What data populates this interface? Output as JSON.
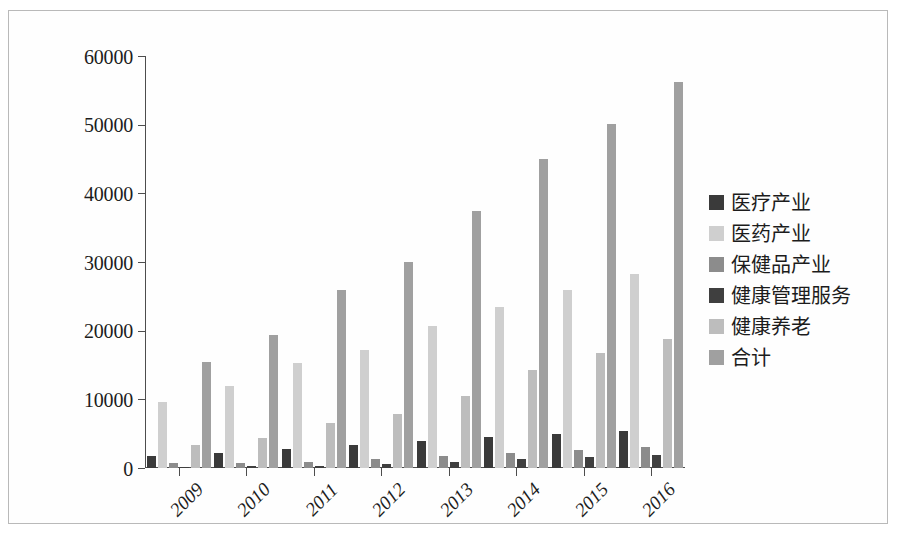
{
  "chart_data": {
    "type": "bar",
    "title": "",
    "subtitle": "",
    "xlabel": "",
    "ylabel": "",
    "categories": [
      "2009",
      "2010",
      "2011",
      "2012",
      "2013",
      "2014",
      "2015",
      "2016"
    ],
    "ylim": [
      0,
      60000
    ],
    "yticks": [
      0,
      10000,
      20000,
      30000,
      40000,
      50000,
      60000
    ],
    "ytick_labels": [
      "0",
      "10000",
      "20000",
      "30000",
      "40000",
      "50000",
      "60000"
    ],
    "grid": false,
    "legend_position": "right",
    "series": [
      {
        "name": "医疗产业",
        "color": "#3a3a3a",
        "values": [
          1800,
          2200,
          2800,
          3300,
          3900,
          4500,
          5000,
          5400
        ]
      },
      {
        "name": "医药产业",
        "color": "#cfcfcf",
        "values": [
          9600,
          11900,
          15300,
          17200,
          20700,
          23400,
          25900,
          28200
        ]
      },
      {
        "name": "保健品产业",
        "color": "#8c8c8c",
        "values": [
          700,
          800,
          900,
          1300,
          1700,
          2200,
          2600,
          3000
        ]
      },
      {
        "name": "健康管理服务",
        "color": "#3f3f3f",
        "values": [
          200,
          250,
          350,
          600,
          900,
          1300,
          1600,
          1900
        ]
      },
      {
        "name": "健康养老",
        "color": "#bdbdbd",
        "values": [
          3400,
          4300,
          6500,
          7900,
          10500,
          14300,
          16700,
          18800
        ]
      },
      {
        "name": "合计",
        "color": "#a0a0a0",
        "values": [
          15500,
          19400,
          25900,
          30000,
          37500,
          45000,
          50100,
          56200
        ]
      }
    ]
  },
  "legend": {
    "items": [
      {
        "label": "医疗产业",
        "swatch": "#3a3a3a"
      },
      {
        "label": "医药产业",
        "swatch": "#cfcfcf"
      },
      {
        "label": "保健品产业",
        "swatch": "#8c8c8c"
      },
      {
        "label": "健康管理服务",
        "swatch": "#3f3f3f"
      },
      {
        "label": "健康养老",
        "swatch": "#bdbdbd"
      },
      {
        "label": "合计",
        "swatch": "#a0a0a0"
      }
    ]
  }
}
